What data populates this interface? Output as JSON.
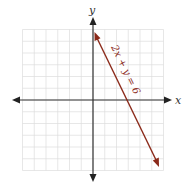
{
  "chart_data": {
    "type": "line",
    "title": "",
    "xlabel": "x",
    "ylabel": "y",
    "xlim": [
      -6,
      6
    ],
    "ylim": [
      -6,
      6
    ],
    "grid": true,
    "tick_labels": false,
    "series": [
      {
        "name": "2x + y = 6",
        "equation": "y = -2x + 6",
        "x": [
          0.1,
          5.7
        ],
        "y": [
          5.8,
          -5.4
        ],
        "color": "#8b2a1a",
        "arrows": "both"
      }
    ],
    "annotations": [
      {
        "text": "2x + y = 6",
        "along_line": true
      }
    ],
    "intercepts": {
      "x": 3,
      "y": 6
    }
  },
  "labels": {
    "x_axis": "x",
    "y_axis": "y",
    "equation": "2x + y = 6"
  },
  "colors": {
    "line": "#8b2a1a",
    "axis": "#333333",
    "grid": "#d9d9d9"
  }
}
